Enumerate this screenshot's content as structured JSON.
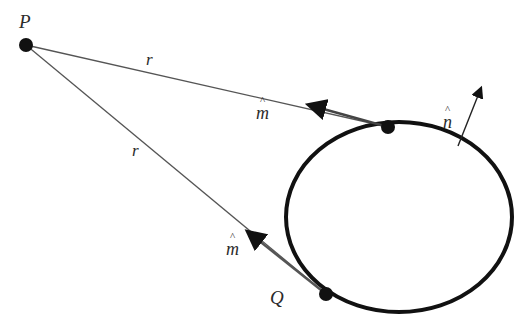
{
  "diagram": {
    "colors": {
      "stroke": "#111111",
      "line": "#555555",
      "text": "#2a2a2a",
      "background": "#ffffff"
    },
    "points": [
      {
        "id": "P",
        "label": "P",
        "x": 26,
        "y": 45
      },
      {
        "id": "top",
        "label": "",
        "x": 388,
        "y": 127
      },
      {
        "id": "Q",
        "label": "Q",
        "x": 326,
        "y": 294
      }
    ],
    "contour": {
      "shape": "ellipse",
      "cx": 399,
      "cy": 217,
      "rx": 113,
      "ry": 95
    },
    "labels": {
      "P": "P",
      "Q": "Q",
      "r_upper": "r",
      "r_lower": "r",
      "m_upper": "m",
      "m_lower": "m",
      "n": "n"
    },
    "vectors": [
      {
        "name": "m-hat-upper",
        "from": [
          388,
          127
        ],
        "to": [
          307,
          104
        ]
      },
      {
        "name": "m-hat-lower",
        "from": [
          326,
          294
        ],
        "to": [
          246,
          231
        ]
      },
      {
        "name": "n-hat",
        "from": [
          458,
          144
        ],
        "to": [
          482,
          85
        ]
      }
    ]
  }
}
